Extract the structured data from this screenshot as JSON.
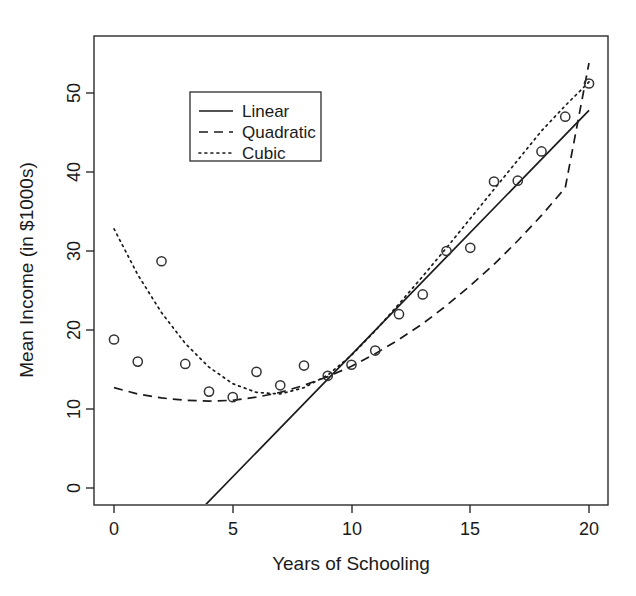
{
  "chart_data": {
    "type": "scatter",
    "title": "",
    "xlabel": "Years of Schooling",
    "ylabel": "Mean Income (in $1000s)",
    "xlim": [
      -0.9,
      20.9
    ],
    "ylim": [
      -3.5,
      55.5
    ],
    "xticks": [
      0,
      5,
      10,
      15,
      20
    ],
    "xtick_labels": [
      "0",
      "5",
      "10",
      "15",
      "20"
    ],
    "yticks": [
      0,
      10,
      20,
      30,
      40,
      50
    ],
    "ytick_labels": [
      "0",
      "10",
      "20",
      "30",
      "40",
      "50"
    ],
    "grid": false,
    "legend_position": "top-left",
    "points": {
      "name": "Mean income by years of schooling",
      "marker": "open-circle",
      "x": [
        0,
        1,
        2,
        3,
        4,
        5,
        6,
        7,
        8,
        9,
        10,
        11,
        12,
        13,
        14,
        15,
        16,
        17,
        18,
        19,
        20
      ],
      "y": [
        18.8,
        16.0,
        28.7,
        15.7,
        12.2,
        11.5,
        14.7,
        13.0,
        15.5,
        14.2,
        15.6,
        17.4,
        22.0,
        24.5,
        30.0,
        30.4,
        38.8,
        38.9,
        42.6,
        47.0,
        51.2
      ]
    },
    "series": [
      {
        "name": "Linear",
        "style": "solid",
        "x": [
          3.7,
          20.0
        ],
        "y": [
          -2.6,
          47.8
        ]
      },
      {
        "name": "Quadratic",
        "style": "dashed",
        "x": [
          0,
          1,
          2,
          3,
          4,
          5,
          6,
          7,
          8,
          9,
          10,
          11,
          12,
          13,
          14,
          15,
          16,
          17,
          18,
          19,
          20
        ],
        "y": [
          12.7,
          11.9,
          11.4,
          11.1,
          11.0,
          11.1,
          11.5,
          12.1,
          13.0,
          14.1,
          15.4,
          17.0,
          18.8,
          20.8,
          23.1,
          25.6,
          28.3,
          31.3,
          34.5,
          38.0,
          53.8
        ]
      },
      {
        "name": "Cubic",
        "style": "dotted",
        "x": [
          0,
          1,
          2,
          3,
          4,
          5,
          6,
          7,
          8,
          9,
          10,
          11,
          12,
          13,
          14,
          15,
          16,
          17,
          18,
          19,
          20
        ],
        "y": [
          32.8,
          27.0,
          22.2,
          18.3,
          15.3,
          13.2,
          12.1,
          11.9,
          12.7,
          14.3,
          16.8,
          19.9,
          23.3,
          26.8,
          30.4,
          34.1,
          37.8,
          41.5,
          45.2,
          48.4,
          51.4
        ]
      }
    ],
    "legend_entries": [
      {
        "label": "Linear",
        "style": "solid"
      },
      {
        "label": "Quadratic",
        "style": "dashed"
      },
      {
        "label": "Cubic",
        "style": "dotted"
      }
    ]
  }
}
